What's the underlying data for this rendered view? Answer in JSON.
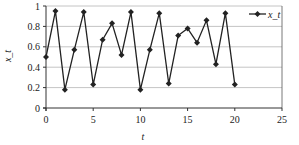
{
  "chart_data": {
    "type": "line",
    "title": "",
    "xlabel": "t",
    "ylabel": "x_t",
    "xlim": [
      0,
      25
    ],
    "ylim": [
      0,
      1
    ],
    "xticks": [
      0,
      5,
      10,
      15,
      20,
      25
    ],
    "yticks": [
      0,
      0.2,
      0.4,
      0.6,
      0.8,
      1
    ],
    "ytick_labels": [
      "0",
      "0.2",
      "0.4",
      "0.6",
      "0.8",
      "1"
    ],
    "grid": "horizontal",
    "legend_position": "top-right",
    "series": [
      {
        "name": "x_t",
        "marker": "diamond",
        "color": "#222222",
        "x": [
          0,
          1,
          2,
          3,
          4,
          5,
          6,
          7,
          8,
          9,
          10,
          11,
          12,
          13,
          14,
          15,
          16,
          17,
          18,
          19,
          20
        ],
        "values": [
          0.5,
          0.95,
          0.18,
          0.57,
          0.94,
          0.23,
          0.67,
          0.83,
          0.52,
          0.94,
          0.18,
          0.57,
          0.93,
          0.24,
          0.71,
          0.78,
          0.64,
          0.86,
          0.43,
          0.93,
          0.23
        ]
      }
    ]
  }
}
